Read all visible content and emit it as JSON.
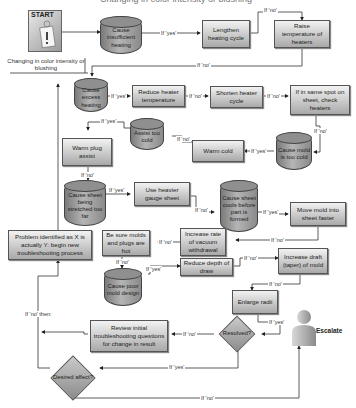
{
  "title_fragment": "Changing in color intensity or blushing",
  "start": {
    "label": "START",
    "caption": "Changing in color intensity or blushing"
  },
  "nodes": {
    "cause_insufficient_heating": "Cause insufficient heating",
    "lengthen_heating_cycle": "Lengthen heating cycle",
    "raise_temperature_heaters": "Raise temperature of heaters",
    "cause_excess_heating": "Cause excess heating",
    "reduce_heater_temperature": "Reduce heater temperature",
    "shorten_heater_cycle": "Shorten heater cycle",
    "same_spot_check_heaters": "If in same spot on sheet, check heaters",
    "assist_too_cold": "Assist too cold",
    "warm_plug_assist": "Warm plug assist",
    "warm_cold": "Warm cold",
    "cause_mold_too_cold": "Cause mold is too cold",
    "cause_sheet_stretched": "Cause sheet being stretched too far",
    "use_heavier_gauge": "Use heavier gauge sheet",
    "cause_sheet_cools": "Cause sheet cools before part is formed",
    "move_mold_faster": "Move mold into sheet faster",
    "increase_vacuum_rate": "Increase rate of vacuum withdrawal",
    "be_sure_molds_hot": "Be sure molds and plugs are hot",
    "problem_identified": "Problem identified as X is actually Y: begin new troubleshooting process",
    "cause_poor_mold_design": "Cause poor mold design",
    "reduce_depth_of_draw": "Reduce depth of draw",
    "increase_draft": "Increase draft (taper) of mold",
    "enlarge_radii": "Enlarge radii",
    "review_initial": "Review initial troubleshooting questions for change in result",
    "resolved": "Resolved?",
    "desired_affect": "Desired affect?",
    "escalate": "Escalate"
  },
  "edge_labels": {
    "yes": "If 'yes'",
    "no": "If 'no'",
    "no_then": "If 'no' then:"
  },
  "colors": {
    "box_top": "#f2f2f2",
    "box_bottom": "#a9a9a9",
    "cylinder": "#8f8f8f",
    "line": "#333333"
  }
}
